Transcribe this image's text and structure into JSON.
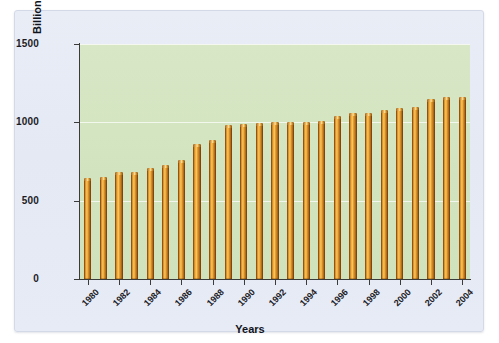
{
  "chart_data": {
    "type": "bar",
    "title": "",
    "xlabel": "Years",
    "ylabel": "Billion Barrels of Oil",
    "ylim": [
      0,
      1500
    ],
    "yticks": [
      0,
      500,
      1000,
      1500
    ],
    "ytick_labels": [
      "0",
      "500",
      "1000",
      "1500"
    ],
    "grid": true,
    "legend": "none",
    "categories": [
      "1980",
      "1981",
      "1982",
      "1983",
      "1984",
      "1985",
      "1986",
      "1987",
      "1988",
      "1989",
      "1990",
      "1991",
      "1992",
      "1993",
      "1994",
      "1995",
      "1996",
      "1997",
      "1998",
      "1999",
      "2000",
      "2001",
      "2002",
      "2003",
      "2004"
    ],
    "xtick_labels": [
      "1980",
      "1982",
      "1984",
      "1986",
      "1988",
      "1990",
      "1992",
      "1994",
      "1996",
      "1998",
      "2000",
      "2002",
      "2004"
    ],
    "values": [
      645,
      650,
      680,
      685,
      710,
      730,
      760,
      860,
      885,
      985,
      990,
      995,
      1000,
      1000,
      1005,
      1010,
      1040,
      1060,
      1060,
      1080,
      1090,
      1100,
      1150,
      1160,
      1160
    ],
    "bar_color": "#d8901f",
    "plot_background": "#d4e5c1",
    "panel_background": "#e6eaf4"
  }
}
